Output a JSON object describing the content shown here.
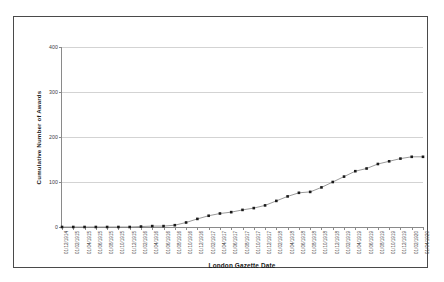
{
  "chart_data": {
    "type": "line",
    "title": "",
    "xlabel": "London Gazette Date",
    "ylabel": "Cumulative Number of Awards",
    "ylim": [
      0,
      400
    ],
    "yticks": [
      0,
      100,
      200,
      300,
      400
    ],
    "grid": true,
    "legend": "none",
    "marker": "square",
    "line_color": "#808080",
    "marker_color": "#1a1a1a",
    "series_name": "Cumulative Number of Awards",
    "categories": [
      "01/12/1914",
      "01/02/1915",
      "01/04/1915",
      "01/06/1915",
      "01/08/1915",
      "01/10/1915",
      "01/12/1915",
      "01/02/1916",
      "01/04/1916",
      "01/06/1916",
      "01/08/1916",
      "01/10/1916",
      "01/12/1916",
      "01/02/1917",
      "01/04/1917",
      "01/06/1917",
      "01/08/1917",
      "01/10/1917",
      "01/12/1917",
      "01/02/1918",
      "01/04/1918",
      "01/06/1918",
      "01/08/1918",
      "01/10/1918",
      "01/12/1918",
      "01/02/1919",
      "01/04/1919",
      "01/06/1919",
      "01/08/1919",
      "01/10/1919",
      "01/12/1919",
      "01/02/1920",
      "01/04/1920"
    ],
    "values": [
      0,
      0,
      0,
      0,
      0,
      0,
      0,
      1,
      2,
      2,
      4,
      10,
      18,
      25,
      30,
      33,
      38,
      42,
      48,
      58,
      68,
      76,
      78,
      88,
      100,
      112,
      124,
      130,
      140,
      146,
      152,
      156,
      156
    ]
  }
}
